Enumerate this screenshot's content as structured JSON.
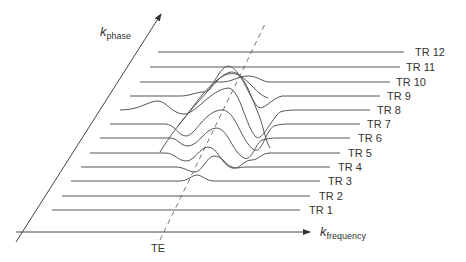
{
  "diagram": {
    "axes": {
      "vertical": {
        "symbol": "k",
        "subscript": "phase"
      },
      "horizontal": {
        "symbol": "k",
        "subscript": "frequency"
      },
      "echo_marker": "TE"
    },
    "rows": [
      {
        "label": "TR 1"
      },
      {
        "label": "TR 2"
      },
      {
        "label": "TR 3"
      },
      {
        "label": "TR 4"
      },
      {
        "label": "TR 5"
      },
      {
        "label": "TR 6"
      },
      {
        "label": "TR 7"
      },
      {
        "label": "TR 8"
      },
      {
        "label": "TR 9"
      },
      {
        "label": "TR 10"
      },
      {
        "label": "TR 11"
      },
      {
        "label": "TR 12"
      }
    ],
    "colors": {
      "line": "#555555",
      "text": "#333333",
      "background": "#ffffff"
    }
  }
}
